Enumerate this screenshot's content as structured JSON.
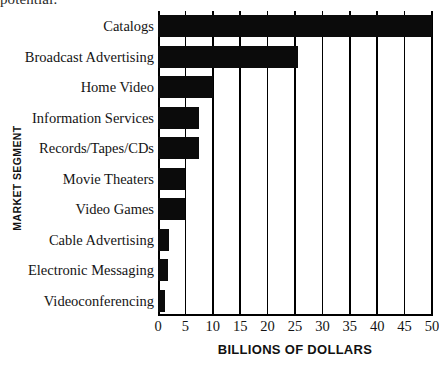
{
  "page": {
    "cutoff_text": "potential."
  },
  "chart_data": {
    "type": "bar",
    "orientation": "horizontal",
    "title": "",
    "xlabel": "BILLIONS OF DOLLARS",
    "ylabel": "MARKET SEGMENT",
    "categories": [
      "Catalogs",
      "Broadcast Advertising",
      "Home Video",
      "Information Services",
      "Records/Tapes/CDs",
      "Movie Theaters",
      "Video Games",
      "Cable Advertising",
      "Electronic Messaging",
      "Videoconferencing"
    ],
    "values": [
      50,
      25.5,
      10,
      7.5,
      7.5,
      5,
      5,
      2,
      1.8,
      1.2
    ],
    "xlim": [
      0,
      50
    ],
    "xticks": [
      0,
      5,
      10,
      15,
      20,
      25,
      30,
      35,
      40,
      45,
      50
    ],
    "xtick_labels": [
      "0",
      "5",
      "10",
      "15",
      "20",
      "25",
      "30",
      "35",
      "40",
      "45",
      "50"
    ],
    "grid": "vertical",
    "legend": "none",
    "bar_color": "#0b0b0b"
  }
}
